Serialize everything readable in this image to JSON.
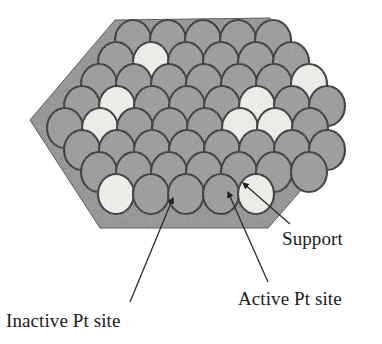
{
  "labels": {
    "support": "Support",
    "active": "Active Pt site",
    "inactive": "Inactive Pt site"
  },
  "colors": {
    "background": "#ffffff",
    "support_top": "#8e8e8e",
    "support_side": "#707070",
    "support_bottom": "#6a6a6a",
    "sphere_inactive": "#9a9a9a",
    "sphere_active": "#f0f0ec",
    "sphere_outline": "#1a1a1a",
    "leader_line": "#2a2a2a",
    "text": "#1b1b1b"
  },
  "geometry": {
    "support_polygon": [
      [
        115,
        20
      ],
      [
        270,
        18
      ],
      [
        336,
        150
      ],
      [
        268,
        228
      ],
      [
        100,
        228
      ],
      [
        30,
        120
      ]
    ],
    "sphere_radius_x": 18,
    "sphere_radius_y": 20
  },
  "spheres": {
    "rows": [
      {
        "row": 1,
        "cy": 40,
        "cx_start": 133,
        "count": 5,
        "step": 35,
        "states": [
          "inactive",
          "inactive",
          "inactive",
          "inactive",
          "inactive"
        ]
      },
      {
        "row": 2,
        "cy": 62,
        "cx_start": 116,
        "count": 6,
        "step": 35,
        "states": [
          "inactive",
          "active",
          "inactive",
          "inactive",
          "inactive",
          "inactive"
        ]
      },
      {
        "row": 3,
        "cy": 84,
        "cx_start": 99,
        "count": 7,
        "step": 35,
        "states": [
          "inactive",
          "inactive",
          "inactive",
          "inactive",
          "inactive",
          "inactive",
          "active"
        ]
      },
      {
        "row": 4,
        "cy": 106,
        "cx_start": 82,
        "count": 8,
        "step": 35,
        "states": [
          "inactive",
          "active",
          "inactive",
          "inactive",
          "inactive",
          "active",
          "inactive",
          "inactive"
        ]
      },
      {
        "row": 5,
        "cy": 128,
        "cx_start": 65,
        "count": 8,
        "step": 35,
        "states": [
          "inactive",
          "active",
          "inactive",
          "inactive",
          "inactive",
          "active",
          "active",
          "inactive"
        ]
      },
      {
        "row": 6,
        "cy": 150,
        "cx_start": 82,
        "count": 8,
        "step": 35,
        "states": [
          "inactive",
          "inactive",
          "inactive",
          "inactive",
          "inactive",
          "inactive",
          "inactive",
          "inactive"
        ]
      },
      {
        "row": 7,
        "cy": 172,
        "cx_start": 99,
        "count": 7,
        "step": 35,
        "states": [
          "inactive",
          "inactive",
          "inactive",
          "inactive",
          "inactive",
          "inactive",
          "inactive"
        ]
      },
      {
        "row": 8,
        "cy": 194,
        "cx_start": 116,
        "count": 5,
        "step": 35,
        "states": [
          "active",
          "inactive",
          "inactive",
          "inactive",
          "active"
        ]
      }
    ]
  },
  "leaders": [
    {
      "name": "support",
      "from": [
        290,
        224
      ],
      "to": [
        243,
        183
      ],
      "arrow": true
    },
    {
      "name": "active",
      "from": [
        268,
        282
      ],
      "to": [
        228,
        192
      ],
      "arrow": true
    },
    {
      "name": "inactive",
      "from": [
        130,
        302
      ],
      "to": [
        173,
        198
      ],
      "arrow": true
    }
  ]
}
